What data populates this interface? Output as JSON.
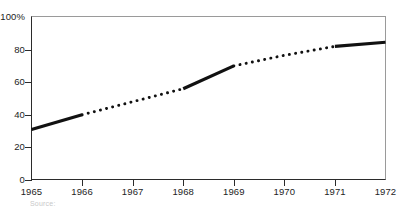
{
  "chart_data": {
    "type": "line",
    "title": "",
    "subtitle": "",
    "xlabel": "",
    "ylabel": "",
    "x": [
      1965,
      1966,
      1967,
      1968,
      1969,
      1970,
      1971,
      1972
    ],
    "xlim": [
      1965,
      1972
    ],
    "ylim": [
      0,
      100
    ],
    "grid": false,
    "legend": "none",
    "xtick_labels": [
      "1965",
      "1966",
      "1967",
      "1968",
      "1969",
      "1970",
      "1971",
      "1972"
    ],
    "ytick_values": [
      0,
      20,
      40,
      60,
      80,
      100
    ],
    "ytick_labels": [
      "0",
      "20",
      "40",
      "60",
      "80",
      "100%"
    ],
    "series": [
      {
        "name": "percentage",
        "points": [
          {
            "x": 1965,
            "y": 31
          },
          {
            "x": 1966,
            "y": 40
          },
          {
            "x": 1967,
            "y": 48
          },
          {
            "x": 1968,
            "y": 56
          },
          {
            "x": 1969,
            "y": 70
          },
          {
            "x": 1970,
            "y": 76.5
          },
          {
            "x": 1971,
            "y": 82
          },
          {
            "x": 1972,
            "y": 84.5
          }
        ],
        "segments": [
          {
            "from": 1965,
            "to": 1966,
            "style": "solid"
          },
          {
            "from": 1966,
            "to": 1968,
            "style": "dotted"
          },
          {
            "from": 1968,
            "to": 1969,
            "style": "solid"
          },
          {
            "from": 1969,
            "to": 1971,
            "style": "dotted"
          },
          {
            "from": 1971,
            "to": 1972,
            "style": "solid"
          }
        ],
        "color": "#111111"
      }
    ]
  },
  "footer": {
    "source_note": "Source:"
  },
  "axis": {
    "percent_suffix": "%"
  }
}
